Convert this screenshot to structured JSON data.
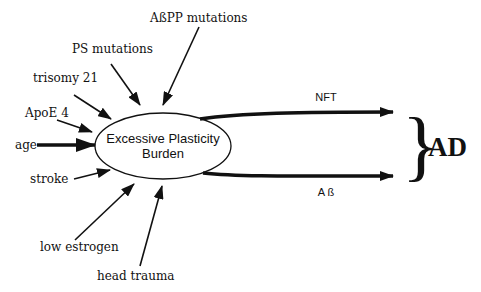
{
  "diagram": {
    "central_node": {
      "line1": "Excessive Plasticity",
      "line2": "Burden"
    },
    "risk_factors": [
      {
        "id": "abpp",
        "label": "AßPP mutations"
      },
      {
        "id": "ps",
        "label": "PS mutations"
      },
      {
        "id": "trisomy",
        "label": "trisomy 21"
      },
      {
        "id": "apoe",
        "label": "ApoE 4"
      },
      {
        "id": "age",
        "label": "age"
      },
      {
        "id": "stroke",
        "label": "stroke"
      },
      {
        "id": "estrogen",
        "label": "low estrogen"
      },
      {
        "id": "trauma",
        "label": "head trauma"
      }
    ],
    "pathways": [
      {
        "id": "nft",
        "label": "NFT"
      },
      {
        "id": "abeta",
        "label": "A ß"
      }
    ],
    "outcome": {
      "brace": "}",
      "label": "AD"
    },
    "colors": {
      "stroke": "#111111",
      "background": "#ffffff"
    }
  }
}
